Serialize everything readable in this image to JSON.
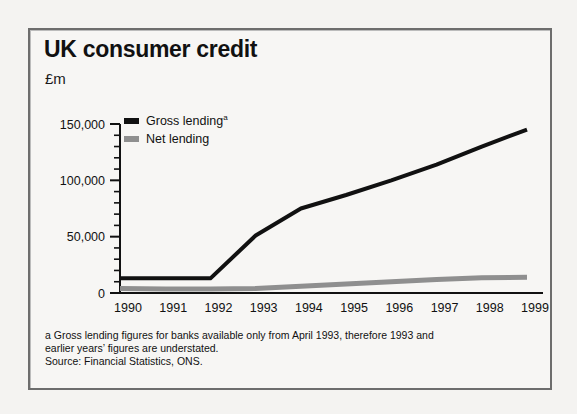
{
  "panel": {
    "title": "UK consumer credit",
    "units": "£m"
  },
  "background_text": {
    "line1": "",
    "line2": "",
    "line3": ""
  },
  "footnote": {
    "line1": "a Gross lending figures for banks available only from April 1993, therefore 1993 and",
    "line2": "earlier years’ figures are understated.",
    "line3": "Source: Financial Statistics, ONS."
  },
  "colors": {
    "gross": "#111111",
    "net": "#8f8f8f",
    "axis": "#111111",
    "panel_border": "#6d6d6d",
    "panel_bg": "#f7f6f4"
  },
  "chart_data": {
    "type": "line",
    "title": "UK consumer credit",
    "xlabel": "",
    "ylabel": "£m",
    "ylim": [
      0,
      150000
    ],
    "yticks": [
      0,
      50000,
      100000,
      150000
    ],
    "ytick_labels": [
      "0",
      "50,000",
      "100,000",
      "150,000"
    ],
    "minor_tick_interval": 10000,
    "grid": false,
    "legend_position": "top-left",
    "categories": [
      1990,
      1991,
      1992,
      1993,
      1994,
      1995,
      1996,
      1997,
      1998,
      1999
    ],
    "xtick_labels": [
      "1990",
      "1991",
      "1992",
      "1993",
      "1994",
      "1995",
      "1996",
      "1997",
      "1998",
      "1999"
    ],
    "series": [
      {
        "name": "Gross lending",
        "footnote_marker": "a",
        "color": "#111111",
        "values": [
          13000,
          13000,
          13000,
          51000,
          75000,
          87000,
          100000,
          114000,
          130000,
          145000
        ]
      },
      {
        "name": "Net lending",
        "footnote_marker": "",
        "color": "#8f8f8f",
        "values": [
          4000,
          3500,
          3500,
          4000,
          6000,
          8000,
          10000,
          12000,
          13500,
          14000
        ]
      }
    ]
  }
}
